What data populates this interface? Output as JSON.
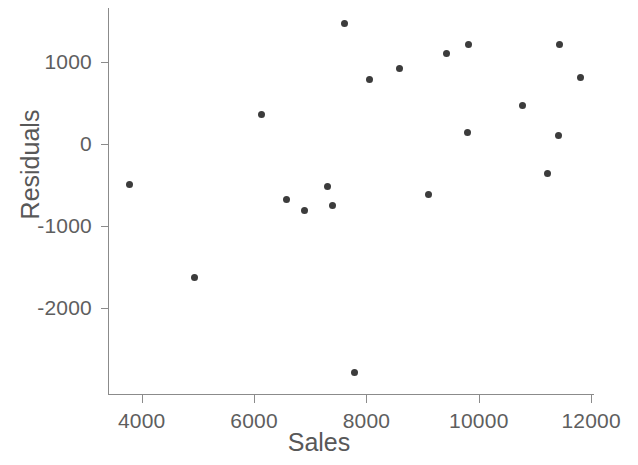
{
  "chart_data": {
    "type": "scatter",
    "title": "",
    "xlabel": "Sales",
    "ylabel": "Residuals",
    "xlim": [
      3400,
      12050
    ],
    "ylim": [
      -3060,
      1660
    ],
    "grid": false,
    "legend": null,
    "marker_color": "#3c3c3c",
    "axis_color": "#8b8b8b",
    "x_ticks": [
      4000,
      6000,
      8000,
      10000,
      12000
    ],
    "x_tick_labels": [
      "4000",
      "6000",
      "8000",
      "10000",
      "12000"
    ],
    "y_ticks": [
      1000,
      0,
      -1000,
      -2000
    ],
    "y_tick_labels": [
      "1000",
      "0",
      "-1000",
      "-2000"
    ],
    "x": [
      3787,
      4940,
      6128,
      6572,
      6891,
      7299,
      7388,
      7618,
      7796,
      8062,
      8594,
      9108,
      9427,
      9800,
      9817,
      10775,
      11218,
      11413,
      11431,
      11803
    ],
    "y": [
      -488,
      -1622,
      366,
      -671,
      -805,
      -512,
      -744,
      1476,
      -2780,
      793,
      927,
      -610,
      1110,
      146,
      1220,
      476,
      -354,
      110,
      1220,
      817
    ],
    "points": [
      {
        "x": 3787,
        "y": -488
      },
      {
        "x": 4940,
        "y": -1622
      },
      {
        "x": 6128,
        "y": 366
      },
      {
        "x": 6572,
        "y": -671
      },
      {
        "x": 6891,
        "y": -805
      },
      {
        "x": 7299,
        "y": -512
      },
      {
        "x": 7388,
        "y": -744
      },
      {
        "x": 7618,
        "y": 1476
      },
      {
        "x": 7796,
        "y": -2780
      },
      {
        "x": 8062,
        "y": 793
      },
      {
        "x": 8594,
        "y": 927
      },
      {
        "x": 9108,
        "y": -610
      },
      {
        "x": 9427,
        "y": 1110
      },
      {
        "x": 9800,
        "y": 146
      },
      {
        "x": 9817,
        "y": 1220
      },
      {
        "x": 10775,
        "y": 476
      },
      {
        "x": 11218,
        "y": -354
      },
      {
        "x": 11413,
        "y": 110
      },
      {
        "x": 11431,
        "y": 1220
      },
      {
        "x": 11803,
        "y": 817
      }
    ],
    "n_points": 20
  }
}
